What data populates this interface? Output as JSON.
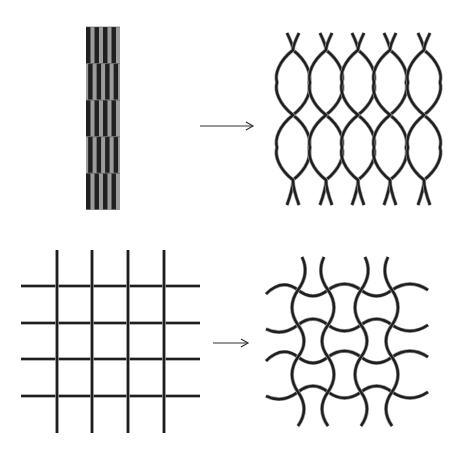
{
  "diagram": {
    "colors": {
      "background": "#ffffff",
      "line_dark": "#1e1e1e",
      "line_highlight": "#9a9a9a",
      "stripe_dark": "#202020",
      "stripe_light": "#9c9c9c",
      "arrow": "#333333"
    },
    "rows": [
      {
        "name": "expanded-diamond-mesh",
        "before": {
          "label": "slit sheet (compressed)",
          "x": 86,
          "y": 27,
          "width": 34,
          "height": 183,
          "segments": 5,
          "stripes_per_segment": 8
        },
        "arrow": {
          "x1": 200,
          "x2": 253,
          "y": 126
        },
        "after": {
          "label": "expanded diamond mesh",
          "columns_x": [
            293,
            326,
            358,
            390,
            424
          ],
          "crossing_rows_y": [
            50,
            115,
            180
          ],
          "top_y": 33,
          "bottom_y": 205,
          "half_width": 16
        }
      },
      {
        "name": "wavy-square-mesh",
        "before": {
          "label": "square grid",
          "vertical_x": [
            57,
            92,
            128,
            164
          ],
          "horizontal_y": [
            286,
            323,
            359,
            396
          ],
          "x_range": [
            21,
            200
          ],
          "y_range": [
            250,
            433
          ]
        },
        "arrow": {
          "x1": 213,
          "x2": 248,
          "y": 343
        },
        "after": {
          "label": "wavy interlocking mesh",
          "vertical_x": [
            298,
            328,
            361,
            392
          ],
          "horizontal_y": [
            290,
            325,
            357,
            392
          ],
          "x_range": [
            266,
            428
          ],
          "y_range": [
            257,
            426
          ],
          "amplitude": 6
        }
      }
    ]
  }
}
